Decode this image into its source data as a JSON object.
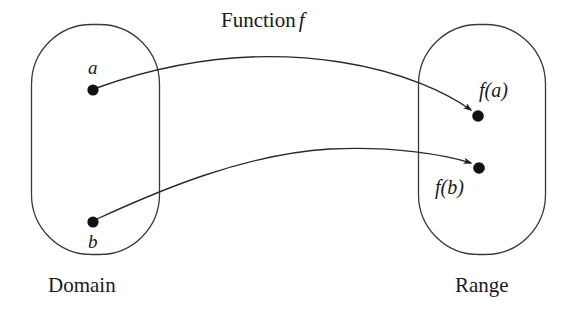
{
  "diagram": {
    "title_text": "Function",
    "title_variable": "f",
    "stroke_color": "#2a2a2a",
    "dot_color": "#111111",
    "background_color": "#ffffff",
    "sets": {
      "domain": {
        "label": "Domain",
        "elements": [
          {
            "label": "a",
            "cx": 93,
            "cy": 90
          },
          {
            "label": "b",
            "cx": 93,
            "cy": 222
          }
        ],
        "box": {
          "x": 31,
          "y": 24,
          "width": 129,
          "height": 231,
          "radius": 60
        }
      },
      "range": {
        "label": "Range",
        "elements": [
          {
            "label": "f(a)",
            "cx": 478,
            "cy": 116
          },
          {
            "label": "f(b)",
            "cx": 479,
            "cy": 168
          }
        ],
        "box": {
          "x": 418,
          "y": 24,
          "width": 128,
          "height": 231,
          "radius": 60
        }
      }
    },
    "mappings": [
      {
        "from": "a",
        "to": "f(a)"
      },
      {
        "from": "b",
        "to": "f(b)"
      }
    ]
  }
}
